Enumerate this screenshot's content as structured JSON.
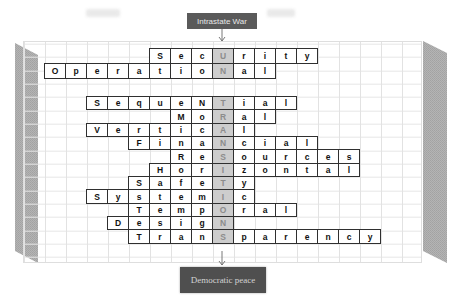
{
  "labels": {
    "top": "Intrastate War",
    "bottom": "Democratic peace"
  },
  "colors": {
    "label_bg": "#5a5a5a",
    "label_text": "#e8e8e8",
    "highlight_bg": "#cdcdcd",
    "highlight_text": "#8c8c8c",
    "cell_border": "#2f2f2f",
    "side_panel": "#b0b0b0"
  },
  "puzzle": {
    "highlight_column": 9,
    "rows": [
      {
        "word": "SecUrity",
        "start_col": 6,
        "highlight_index": 3,
        "letters": [
          "S",
          "e",
          "c",
          "U",
          "r",
          "i",
          "t",
          "y"
        ]
      },
      {
        "word": "OperatioNal",
        "start_col": 1,
        "highlight_index": 8,
        "letters": [
          "O",
          "p",
          "e",
          "r",
          "a",
          "t",
          "i",
          "o",
          "N",
          "a",
          "l"
        ]
      },
      {
        "word": "SequeNTial",
        "start_col": 3,
        "highlight_index": 6,
        "letters": [
          "S",
          "e",
          "q",
          "u",
          "e",
          "N",
          "T",
          "i",
          "a",
          "l"
        ]
      },
      {
        "word": "MoRal",
        "start_col": 7,
        "highlight_index": 2,
        "letters": [
          "M",
          "o",
          "R",
          "a",
          "l"
        ]
      },
      {
        "word": "VerticAl",
        "start_col": 3,
        "highlight_index": 6,
        "letters": [
          "V",
          "e",
          "r",
          "t",
          "i",
          "c",
          "A",
          "l"
        ]
      },
      {
        "word": "FinaNcial",
        "start_col": 5,
        "highlight_index": 4,
        "letters": [
          "F",
          "i",
          "n",
          "a",
          "N",
          "c",
          "i",
          "a",
          "l"
        ]
      },
      {
        "word": "ReSources",
        "start_col": 7,
        "highlight_index": 2,
        "letters": [
          "R",
          "e",
          "S",
          "o",
          "u",
          "r",
          "c",
          "e",
          "s"
        ]
      },
      {
        "word": "HorIzontal",
        "start_col": 6,
        "highlight_index": 3,
        "letters": [
          "H",
          "o",
          "r",
          "I",
          "z",
          "o",
          "n",
          "t",
          "a",
          "l"
        ]
      },
      {
        "word": "SafeTy",
        "start_col": 5,
        "highlight_index": 4,
        "letters": [
          "S",
          "a",
          "f",
          "e",
          "T",
          "y"
        ]
      },
      {
        "word": "SystemIc",
        "start_col": 3,
        "highlight_index": 6,
        "letters": [
          "S",
          "y",
          "s",
          "t",
          "e",
          "m",
          "I",
          "c"
        ]
      },
      {
        "word": "TempOral",
        "start_col": 5,
        "highlight_index": 4,
        "letters": [
          "T",
          "e",
          "m",
          "p",
          "O",
          "r",
          "a",
          "l"
        ]
      },
      {
        "word": "DesigN",
        "start_col": 4,
        "highlight_index": 5,
        "letters": [
          "D",
          "e",
          "s",
          "i",
          "g",
          "N"
        ]
      },
      {
        "word": "TranSparency",
        "start_col": 5,
        "highlight_index": 4,
        "letters": [
          "T",
          "r",
          "a",
          "n",
          "S",
          "p",
          "a",
          "r",
          "e",
          "n",
          "c",
          "y"
        ]
      }
    ]
  }
}
